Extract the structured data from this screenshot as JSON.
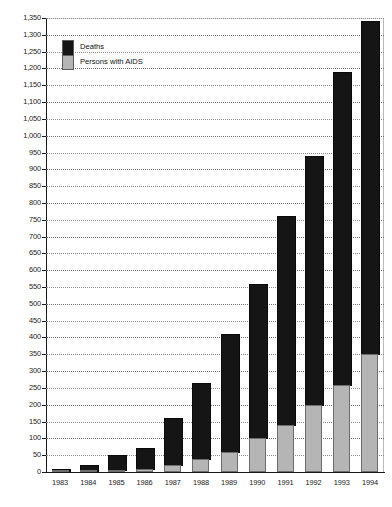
{
  "chart_data": {
    "type": "bar",
    "stacked": true,
    "title": "",
    "subtitle": "",
    "xlabel": "",
    "ylabel": "",
    "categories": [
      "1983",
      "1984",
      "1985",
      "1986",
      "1987",
      "1988",
      "1989",
      "1990",
      "1991",
      "1992",
      "1993",
      "1994"
    ],
    "series": [
      {
        "name": "Persons with AIDS",
        "color": "#b5b5b5",
        "values": [
          2,
          3,
          6,
          10,
          20,
          40,
          60,
          100,
          140,
          200,
          260,
          350
        ]
      },
      {
        "name": "Deaths",
        "color": "#151515",
        "values": [
          8,
          17,
          44,
          60,
          140,
          225,
          350,
          460,
          620,
          740,
          930,
          990
        ]
      }
    ],
    "totals": [
      10,
      20,
      50,
      70,
      160,
      265,
      410,
      560,
      760,
      940,
      1190,
      1340
    ],
    "ylim": [
      0,
      1350
    ],
    "ytick_step": 50,
    "ytick_labels": [
      "0",
      "50",
      "100",
      "150",
      "200",
      "250",
      "300",
      "350",
      "400",
      "450",
      "500",
      "550",
      "600",
      "650",
      "700",
      "750",
      "800",
      "850",
      "900",
      "950",
      "1,000",
      "1,050",
      "1,100",
      "1,150",
      "1,200",
      "1,250",
      "1,300",
      "1,350"
    ],
    "grid": true,
    "grid_style": "dotted-horizontal",
    "legend_position": "top-left",
    "legend_entries": [
      "Deaths",
      "Persons with AIDS"
    ]
  },
  "legend": {
    "deaths_label": "Deaths",
    "persons_label": "Persons with AIDS"
  },
  "axis": {
    "y_max_label": "1,350",
    "y_min_label": "0"
  }
}
